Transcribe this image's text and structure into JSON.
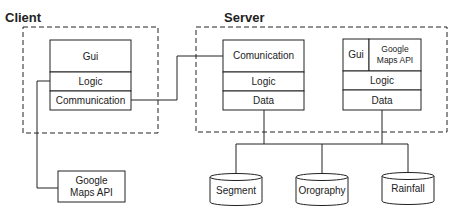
{
  "client": {
    "title": "Client",
    "stack": [
      "Gui",
      "Logic",
      "Communication"
    ],
    "external": {
      "line1": "Google",
      "line2": "Maps API"
    }
  },
  "server": {
    "title": "Server",
    "stack1": [
      "Comunication",
      "Logic",
      "Data"
    ],
    "stack2": {
      "top_left": "Gui",
      "top_right_line1": "Google",
      "top_right_line2": "Maps API",
      "middle": "Logic",
      "bottom": "Data"
    }
  },
  "databases": [
    "Segment",
    "Orography",
    "Rainfall"
  ],
  "colors": {
    "stroke": "#222222",
    "text": "#222222",
    "background": "#ffffff"
  }
}
